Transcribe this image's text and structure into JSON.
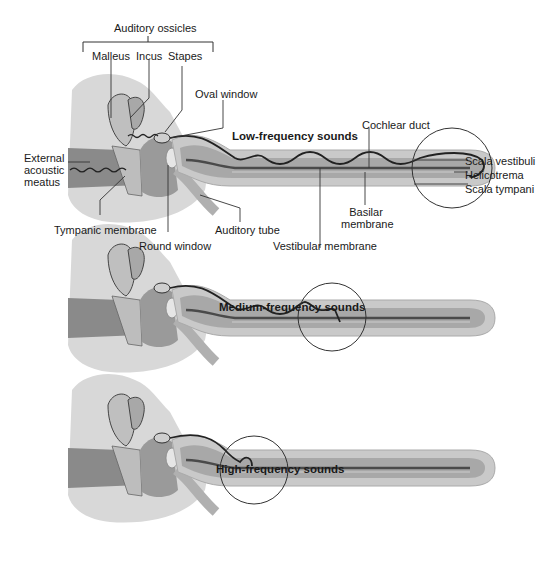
{
  "panels": [
    {
      "id": "low",
      "title": "Low-frequency sounds",
      "labels": {
        "auditory_ossicles": "Auditory ossicles",
        "malleus": "Malleus",
        "incus": "Incus",
        "stapes": "Stapes",
        "oval_window": "Oval window",
        "external_acoustic_meatus": [
          "External",
          "acoustic",
          "meatus"
        ],
        "tympanic_membrane": "Tympanic membrane",
        "round_window": "Round window",
        "auditory_tube": "Auditory tube",
        "vestibular_membrane": "Vestibular membrane",
        "basilar_membrane": [
          "Basilar",
          "membrane"
        ],
        "cochlear_duct": "Cochlear duct",
        "scala_vestibuli": "Scala vestibuli",
        "helicotrema": "Helicotrema",
        "scala_tympani": "Scala tympani"
      }
    },
    {
      "id": "medium",
      "title": "Medium-frequency sounds"
    },
    {
      "id": "high",
      "title": "High-frequency sounds"
    }
  ],
  "colors": {
    "bone": "#d9d9d9",
    "canal": "#7a7a7a",
    "cochlea_outer": "#c8c8c8",
    "cochlea_inner": "#9a9a9a",
    "membrane": "#3a3a3a",
    "wave": "#222222"
  }
}
